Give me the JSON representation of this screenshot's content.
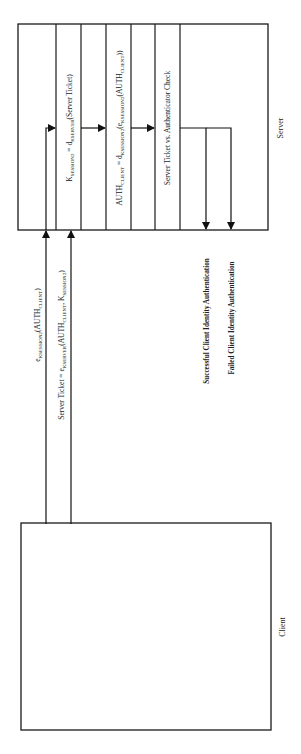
{
  "diagram": {
    "orientation": "rotated-90-ccw",
    "entities": {
      "server": {
        "label": "Server"
      },
      "client": {
        "label": "Client"
      }
    },
    "messages": [
      {
        "id": "msg1",
        "main": "e",
        "sub": "KSESSION2",
        "rest": "(AUTH",
        "sub2": "CLIENT",
        "tail": ")"
      },
      {
        "id": "msg2",
        "pre": "Server Ticket = e",
        "sub": "KSERVER",
        "rest": "(AUTH",
        "sub2": "CLIENT",
        "mid": ", K",
        "sub3": "SESSION2",
        "tail": ")"
      }
    ],
    "server_steps": [
      {
        "id": "step1",
        "pre": "K",
        "sub": "SESSION2",
        "mid": " = d",
        "sub2": "KSERVER",
        "tail": "(Server Ticket)"
      },
      {
        "id": "step2",
        "pre": "AUTH",
        "sub": "CLIENT",
        "mid": " = d",
        "sub2": "KSESSION2",
        "mid2": "(e",
        "sub3": "KSESSION2",
        "mid3": "(AUTH",
        "sub4": "CLIENT",
        "tail": "))"
      },
      {
        "id": "step3",
        "text": "Server Ticket vs. Authenticator Check"
      }
    ],
    "outcomes": [
      {
        "id": "success",
        "label": "Successful Client Identity Authentication"
      },
      {
        "id": "failure",
        "label": "Failed Client Identity Authentication"
      }
    ],
    "colors": {
      "line": "#1a1a1a",
      "text": "#222222",
      "background": "#ffffff"
    }
  }
}
